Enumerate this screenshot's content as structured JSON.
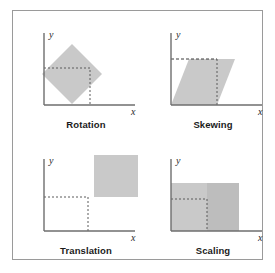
{
  "figure": {
    "background_color": "#ffffff",
    "frame_color": "#9a9a9a",
    "shape_fill": "#c9c9c9",
    "shape_fill_dark": "#b5b5b5",
    "axis_color": "#6e6e6e",
    "guide_color": "#5a5a5a"
  },
  "panels": [
    {
      "id": "rotation",
      "caption": "Rotation",
      "axis_x_label": "x",
      "axis_y_label": "y",
      "description": "Unit square rotated about the origin corner into a diamond",
      "original_square": {
        "x": 0,
        "y": 0,
        "width": 46,
        "height": 46
      },
      "transformed_shape": {
        "type": "polygon",
        "points": "10,47 40,17 70,47 40,77"
      }
    },
    {
      "id": "skewing",
      "caption": "Skewing",
      "axis_x_label": "x",
      "axis_y_label": "y",
      "description": "Unit square sheared horizontally into a parallelogram",
      "original_square": {
        "x": 0,
        "y": 0,
        "width": 46,
        "height": 46
      },
      "transformed_shape": {
        "type": "polygon",
        "points": "12,78 30,32 76,32 58,78"
      }
    },
    {
      "id": "translation",
      "caption": "Translation",
      "axis_x_label": "x",
      "axis_y_label": "y",
      "description": "Unit square translated up and to the right",
      "original_square": {
        "x": 0,
        "y": 0,
        "width": 46,
        "height": 46
      },
      "transformed_shape": {
        "type": "rect",
        "x": 56,
        "y": 2,
        "width": 46,
        "height": 44
      }
    },
    {
      "id": "scaling",
      "caption": "Scaling",
      "axis_x_label": "x",
      "axis_y_label": "y",
      "description": "Unit square scaled up in both axes",
      "original_square": {
        "x": 0,
        "y": 0,
        "width": 46,
        "height": 46
      },
      "transformed_shape": {
        "type": "rect",
        "x": 12,
        "y": 28,
        "width": 68,
        "height": 50
      }
    }
  ]
}
